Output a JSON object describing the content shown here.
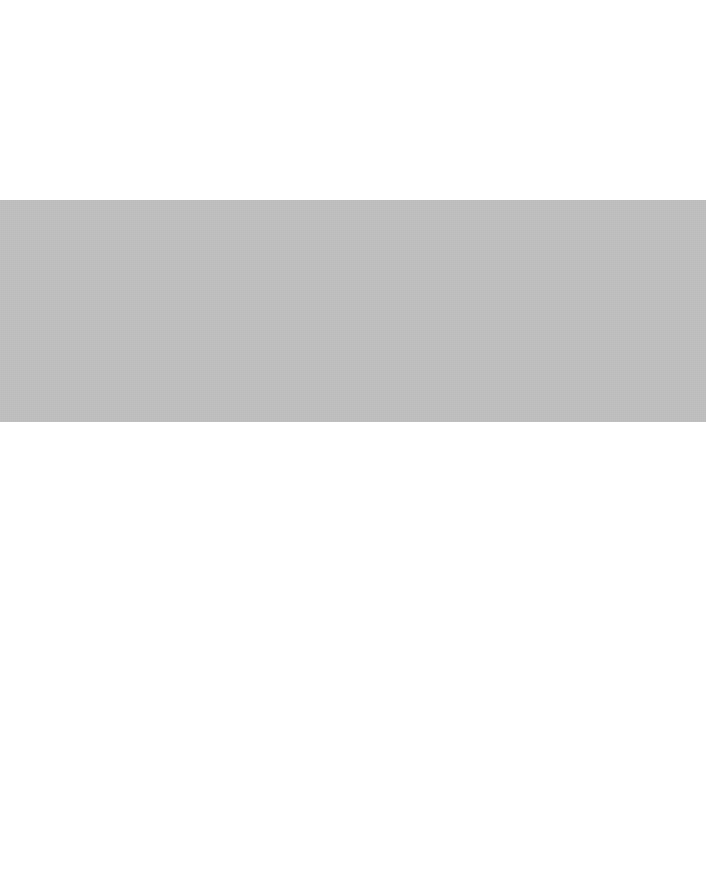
{
  "canvas": {
    "width": 706,
    "height": 877,
    "background_color": "#ffffff"
  },
  "content": {
    "has_text": false,
    "has_icons": false,
    "description": ""
  },
  "regions": {
    "top": {
      "name": "empty-white-area-above-band",
      "color": "#ffffff",
      "top": 0,
      "height": 200,
      "text": ""
    },
    "band": {
      "name": "gray-placeholder-band",
      "color": "#bfbfbf",
      "left": 0,
      "top": 200,
      "width": 706,
      "height": 222,
      "text": ""
    },
    "bottom": {
      "name": "empty-white-area-below-band",
      "color": "#ffffff",
      "top": 422,
      "height": 455,
      "text": ""
    }
  }
}
